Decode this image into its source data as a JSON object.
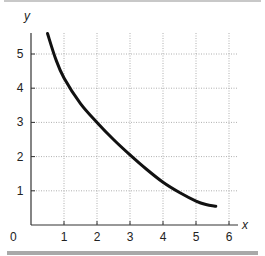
{
  "chart_data": {
    "type": "line",
    "title": "",
    "xlabel": "x",
    "ylabel": "y",
    "xlim": [
      0,
      6
    ],
    "ylim": [
      0,
      5.7
    ],
    "x_ticks": [
      "1",
      "2",
      "3",
      "4",
      "5",
      "6"
    ],
    "y_ticks": [
      "1",
      "2",
      "3",
      "4",
      "5"
    ],
    "origin_label": "0",
    "grid": true,
    "grid_style": "dotted",
    "legend": null,
    "series": [
      {
        "name": "curve",
        "color": "#111111",
        "x": [
          0.5,
          0.75,
          1,
          1.5,
          2,
          2.5,
          3,
          3.5,
          4,
          4.5,
          5,
          5.3,
          5.6
        ],
        "y": [
          5.6,
          4.85,
          4.3,
          3.55,
          3.0,
          2.5,
          2.05,
          1.63,
          1.25,
          0.95,
          0.7,
          0.6,
          0.55
        ]
      }
    ]
  }
}
